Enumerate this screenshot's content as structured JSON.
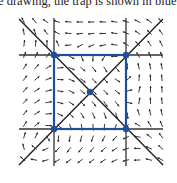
{
  "caption": "e drawing, the trap is shown in blue.",
  "colors": {
    "axis_line": "#333333",
    "trap": "#1f4e9c",
    "arrow": "#222222",
    "background": "#ffffff"
  },
  "diagram": {
    "type": "phase-portrait",
    "grid_lines": {
      "horizontal": [
        {
          "y": 55,
          "x1": 19,
          "x2": 163
        },
        {
          "y": 129,
          "x1": 19,
          "x2": 163
        }
      ],
      "vertical": [
        {
          "x": 54,
          "y1": 18,
          "y2": 166
        },
        {
          "x": 126,
          "y1": 18,
          "y2": 166
        }
      ]
    },
    "diagonals": [
      {
        "x1": 19,
        "y1": 19,
        "x2": 163,
        "y2": 165
      },
      {
        "x1": 163,
        "y1": 19,
        "x2": 19,
        "y2": 165
      }
    ],
    "trap_square": {
      "x1": 54,
      "y1": 55,
      "x2": 126,
      "y2": 129,
      "label": "trap"
    },
    "equilibria": [
      {
        "x": 54,
        "y": 55
      },
      {
        "x": 126,
        "y": 55
      },
      {
        "x": 54,
        "y": 129
      },
      {
        "x": 126,
        "y": 129
      },
      {
        "x": 90,
        "y": 92
      }
    ],
    "field": {
      "x_start": 24,
      "x_end": 162,
      "y_start": 22,
      "y_end": 166,
      "step": 11.5,
      "arrow_len": 5
    }
  }
}
